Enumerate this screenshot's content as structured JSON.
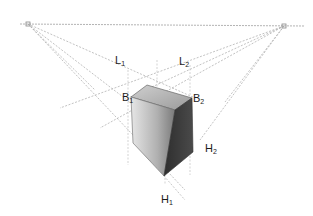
{
  "diagram": {
    "type": "two-point perspective construction of a box",
    "horizon_line": {
      "y": 25
    },
    "vanishing_points": [
      {
        "name": "left-vanishing-point",
        "x": 28,
        "y": 24
      },
      {
        "name": "right-vanishing-point",
        "x": 284,
        "y": 26
      }
    ],
    "labels": [
      {
        "id": "L1",
        "base": "L",
        "sub": "1",
        "x": 115,
        "y": 58
      },
      {
        "id": "L2",
        "base": "L",
        "sub": "2",
        "x": 179,
        "y": 59
      },
      {
        "id": "B1",
        "base": "B",
        "sub": "1",
        "x": 124,
        "y": 95
      },
      {
        "id": "B2",
        "base": "B",
        "sub": "2",
        "x": 193,
        "y": 96
      },
      {
        "id": "H2",
        "base": "H",
        "sub": "2",
        "x": 205,
        "y": 146
      },
      {
        "id": "H1",
        "base": "H",
        "sub": "1",
        "x": 161,
        "y": 197
      }
    ],
    "colors": {
      "line": "#9a9a9a",
      "top_face": "#b8b8b8",
      "left_face_light": "#d8d8d8",
      "left_face_dark": "#8a8a8a",
      "right_face": "#3a3a3a",
      "text": "#1a1a1a"
    }
  }
}
